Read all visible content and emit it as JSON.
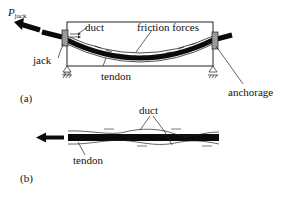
{
  "diagram": {
    "panel_a": {
      "caption": "(a)",
      "labels": {
        "force": "P",
        "force_subscript": "jack",
        "duct": "duct",
        "friction": "friction forces",
        "jack": "jack",
        "tendon": "tendon",
        "anchorage": "anchorage"
      }
    },
    "panel_b": {
      "caption": "(b)",
      "labels": {
        "duct": "duct",
        "tendon": "tendon"
      }
    },
    "colors": {
      "ink": "#111111",
      "tendon": "#0a0a0a",
      "plate": "#9a9a9a",
      "background": "#ffffff"
    }
  }
}
